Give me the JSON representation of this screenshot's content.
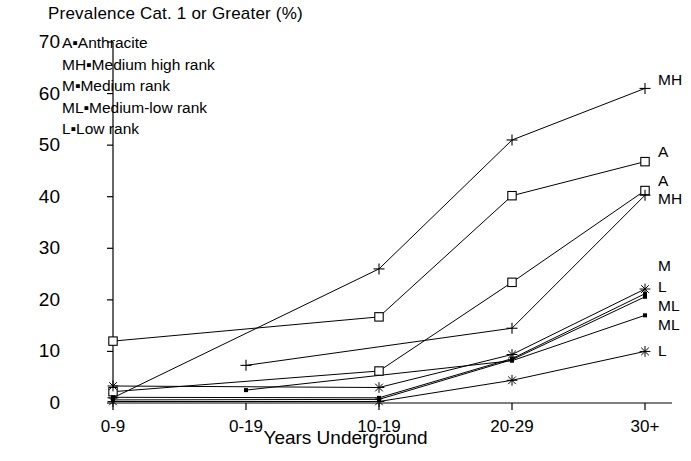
{
  "title": "Prevalence Cat. 1 or Greater (%)",
  "legend": {
    "lines": [
      "A▪Anthracite",
      "MH▪Medium high rank",
      "M▪Medium rank",
      "ML▪Medium-low rank",
      "L▪Low rank"
    ]
  },
  "axis": {
    "x_title": "Years Underground",
    "y_ticks": [
      "70",
      "60",
      "50",
      "40",
      "30",
      "20",
      "10",
      "0"
    ],
    "x_ticks": [
      "0-9",
      "0-19",
      "10-19",
      "20-29",
      "30+"
    ]
  },
  "series_labels": [
    {
      "text": "MH",
      "y": 80
    },
    {
      "text": "A",
      "y": 152
    },
    {
      "text": "A",
      "y": 181
    },
    {
      "text": "MH",
      "y": 199
    },
    {
      "text": "M",
      "y": 266
    },
    {
      "text": "L",
      "y": 287
    },
    {
      "text": "ML",
      "y": 306
    },
    {
      "text": "ML",
      "y": 325
    },
    {
      "text": "L",
      "y": 351
    }
  ],
  "chart_data": {
    "type": "line",
    "title": "Prevalence Cat. 1 or Greater (%)",
    "xlabel": "Years Underground",
    "ylabel": "Prevalence Cat. 1 or Greater (%)",
    "categories": [
      "0-9",
      "0-19",
      "10-19",
      "20-29",
      "30+"
    ],
    "ylim": [
      0,
      70
    ],
    "xlim_categories_positions": [
      0,
      1,
      2,
      3,
      4
    ],
    "grid": false,
    "legend_position": "right-of-plot (end-of-line labels)",
    "marker_legend": {
      "plus": "+",
      "square": "open square",
      "asterisk": "asterisk",
      "dot": "filled dot"
    },
    "series": [
      {
        "name": "MH",
        "label": "MH",
        "marker": "plus",
        "x": [
          "0-9",
          "10-19",
          "20-29",
          "30+"
        ],
        "values": [
          1.0,
          26.0,
          51.0,
          61.0
        ]
      },
      {
        "name": "A",
        "label": "A",
        "marker": "square",
        "x": [
          "0-9",
          "10-19",
          "20-29",
          "30+"
        ],
        "values": [
          12.0,
          16.7,
          40.2,
          46.8
        ]
      },
      {
        "name": "A-2",
        "label": "A",
        "marker": "square",
        "x": [
          "0-9",
          "10-19",
          "20-29",
          "30+"
        ],
        "values": [
          2.2,
          6.2,
          23.4,
          41.2
        ]
      },
      {
        "name": "MH-2",
        "label": "MH",
        "marker": "plus",
        "x": [
          "0-19",
          "20-29",
          "30+"
        ],
        "values": [
          7.3,
          14.5,
          40.3
        ]
      },
      {
        "name": "M",
        "label": "M",
        "marker": "asterisk",
        "x": [
          "0-9",
          "10-19",
          "20-29",
          "30+"
        ],
        "values": [
          3.3,
          3.0,
          9.4,
          22.1
        ]
      },
      {
        "name": "L",
        "label": "L",
        "marker": "dot",
        "x": [
          "0-9",
          "10-19",
          "20-29",
          "30+"
        ],
        "values": [
          1.1,
          1.0,
          8.6,
          21.2
        ]
      },
      {
        "name": "ML",
        "label": "ML",
        "marker": "dot",
        "x": [
          "0-9",
          "10-19",
          "20-29",
          "30+"
        ],
        "values": [
          0.6,
          0.7,
          8.4,
          20.6
        ]
      },
      {
        "name": "ML-2",
        "label": "ML",
        "marker": "dot",
        "x": [
          "0-19",
          "20-29",
          "30+"
        ],
        "values": [
          2.5,
          8.2,
          17.0
        ]
      },
      {
        "name": "L-2",
        "label": "L",
        "marker": "asterisk",
        "x": [
          "0-9",
          "10-19",
          "20-29",
          "30+"
        ],
        "values": [
          0.3,
          0.3,
          4.4,
          10.0
        ]
      }
    ]
  }
}
